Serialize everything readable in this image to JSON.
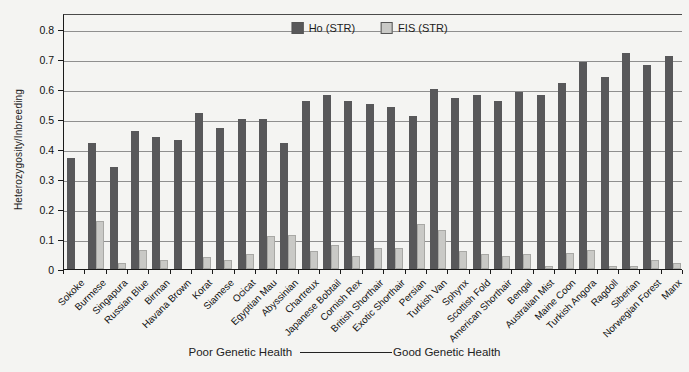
{
  "chart_data": {
    "type": "bar",
    "title": "",
    "ylabel": "Heterozygosity/Inbreeding",
    "xlabel": "",
    "ylim": [
      0,
      0.8
    ],
    "ytick_step": 0.1,
    "grid": true,
    "legend_position": "top-center",
    "caption": {
      "left": "Poor Genetic Health",
      "right": "Good Genetic Health"
    },
    "categories": [
      "Sokoke",
      "Burmese",
      "Singapura",
      "Russian Blue",
      "Birman",
      "Havana Brown",
      "Korat",
      "Siamese",
      "Ocicat",
      "Egyptian Mau",
      "Abyssinian",
      "Chartreux",
      "Japanese Bobtail",
      "Cornish Rex",
      "British Shorthair",
      "Exotic Shorthair",
      "Persian",
      "Turkish Van",
      "Sphynx",
      "Scottish Fold",
      "American Shorthair",
      "Bengal",
      "Australian Mist",
      "Maine Coon",
      "Turkish Angora",
      "Ragdoll",
      "Siberian",
      "Norwegian Forest",
      "Manx"
    ],
    "series": [
      {
        "name": "Ho (STR)",
        "color": "#58585a",
        "values": [
          0.37,
          0.42,
          0.34,
          0.46,
          0.44,
          0.43,
          0.52,
          0.47,
          0.5,
          0.5,
          0.42,
          0.56,
          0.58,
          0.56,
          0.55,
          0.54,
          0.51,
          0.6,
          0.57,
          0.58,
          0.56,
          0.59,
          0.58,
          0.62,
          0.69,
          0.64,
          0.72,
          0.68,
          0.71
        ]
      },
      {
        "name": "FIS (STR)",
        "color": "#c9c9c6",
        "values": [
          0,
          0.16,
          0.02,
          0.065,
          0.03,
          0,
          0.04,
          0.03,
          0.05,
          0.11,
          0.115,
          0.06,
          0.08,
          0.045,
          0.07,
          0.07,
          0.15,
          0.13,
          0.06,
          0.05,
          0.045,
          0.05,
          0.01,
          0.055,
          0.065,
          0.01,
          0.01,
          0.03,
          0.02
        ]
      }
    ]
  }
}
